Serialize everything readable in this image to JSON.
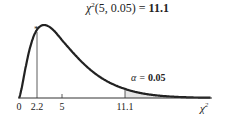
{
  "chart_data": {
    "type": "line",
    "title_parts": {
      "prefix": "χ",
      "sup": "2",
      "args": "(5, 0.05) = ",
      "value": "11.1"
    },
    "distribution": "chi-square",
    "degrees_of_freedom": 5,
    "alpha": 0.05,
    "critical_value": 11.1,
    "observed_marker": {
      "x": 2.2,
      "symbol": "*"
    },
    "shaded_region": {
      "from": 11.1,
      "to": "infinity",
      "label": "α = 0.05"
    },
    "xlabel": "χ²",
    "ylabel": "",
    "x_ticks": [
      0,
      2.2,
      5,
      11.1
    ],
    "x_tick_labels": [
      "0",
      "2.2",
      "5",
      "11.1"
    ],
    "xlim": [
      0,
      20
    ],
    "grid": false,
    "legend": null,
    "colors": {
      "curve": "#222222",
      "shade": "#e6e6e6",
      "axis": "#333333"
    }
  },
  "labels": {
    "title_main": "χ",
    "title_sup": "2",
    "title_args": "(5, 0.05) = ",
    "title_value": "11.1",
    "alpha_prefix": "α = ",
    "alpha_value": "0.05",
    "star": "*",
    "xlabel": "χ",
    "xlabel_sup": "2",
    "tick_0": "0",
    "tick_1": "2.2",
    "tick_2": "5",
    "tick_3": "11.1"
  }
}
